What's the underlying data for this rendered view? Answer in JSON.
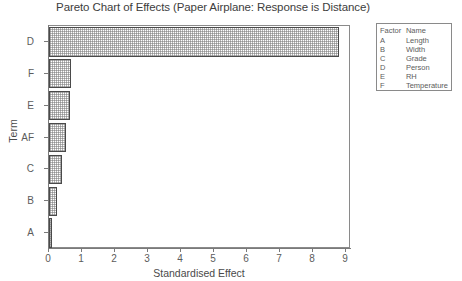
{
  "chart_data": {
    "type": "bar",
    "orientation": "horizontal",
    "title": "Pareto Chart of Effects (Paper Airplane: Response is Distance)",
    "xlabel": "Standardised Effect",
    "ylabel": "Term",
    "categories": [
      "D",
      "F",
      "E",
      "AF",
      "C",
      "B",
      "A"
    ],
    "values": [
      8.8,
      0.68,
      0.65,
      0.52,
      0.4,
      0.25,
      0.08
    ],
    "xlim": [
      0,
      9.15
    ],
    "xticks": [
      0,
      1,
      2,
      3,
      4,
      5,
      6,
      7,
      8,
      9
    ],
    "xtick_labels": [
      "0",
      "1",
      "2",
      "3",
      "4",
      "5",
      "6",
      "7",
      "8",
      "9"
    ],
    "grid": false,
    "bar_fill": "#d8d8d8",
    "bar_edge": "#4a4a4a",
    "legend_position": "right-outside"
  },
  "legend": {
    "headers": [
      "Factor",
      "Name"
    ],
    "rows": [
      {
        "factor": "A",
        "name": "Length"
      },
      {
        "factor": "B",
        "name": "Width"
      },
      {
        "factor": "C",
        "name": "Grade"
      },
      {
        "factor": "D",
        "name": "Person"
      },
      {
        "factor": "E",
        "name": "RH"
      },
      {
        "factor": "F",
        "name": "Temperature"
      }
    ]
  }
}
